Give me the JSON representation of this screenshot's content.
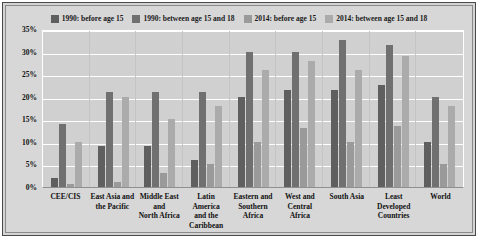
{
  "chart_data": {
    "type": "bar",
    "title": "",
    "xlabel": "",
    "ylabel": "",
    "ylim": [
      0,
      35
    ],
    "grid": true,
    "legend_position": "top-center",
    "y_ticks": [
      "35%",
      "30%",
      "25%",
      "20%",
      "15%",
      "10%",
      "5%",
      "0%"
    ],
    "y_tick_values": [
      35,
      30,
      25,
      20,
      15,
      10,
      5,
      0
    ],
    "categories": [
      "CEE/CIS",
      "East Asia and the Pacific",
      "Middle East and North Africa",
      "Latin America and the Caribbean",
      "Eastern and Southern Africa",
      "West and Central Africa",
      "South Asia",
      "Least Developed Countries",
      "World"
    ],
    "category_lines": [
      [
        "CEE/CIS"
      ],
      [
        "East Asia and",
        "the Pacific"
      ],
      [
        "Middle East",
        "and",
        "North Africa"
      ],
      [
        "Latin America",
        "and the",
        "Caribbean"
      ],
      [
        "Eastern and",
        "Southern",
        "Africa"
      ],
      [
        "West and",
        "Central Africa"
      ],
      [
        "South Asia"
      ],
      [
        "Least Developed",
        "Countries"
      ],
      [
        "World"
      ]
    ],
    "series": [
      {
        "name": "1990: before age 15",
        "color": "#5f5f5f",
        "values": [
          2,
          9,
          9,
          6,
          20,
          21.5,
          21.5,
          22.5,
          10
        ]
      },
      {
        "name": "1990: between age 15 and 18",
        "color": "#707070",
        "values": [
          14,
          21,
          21,
          21,
          30,
          30,
          32.5,
          31.5,
          20
        ]
      },
      {
        "name": "2014: before age 15",
        "color": "#9a9a9a",
        "values": [
          0.7,
          1.2,
          3,
          5,
          10,
          13,
          10,
          13.5,
          5
        ]
      },
      {
        "name": "2014: between age 15 and 18",
        "color": "#ababab",
        "values": [
          10,
          20,
          15,
          18,
          26,
          28,
          26,
          29,
          18
        ]
      }
    ]
  },
  "colors": {
    "plot_background": "#d0d0d0",
    "panel_background": "#d7d7d7",
    "gridline": "#ffffff",
    "frame": "#4a4a4a",
    "text": "#111111"
  }
}
